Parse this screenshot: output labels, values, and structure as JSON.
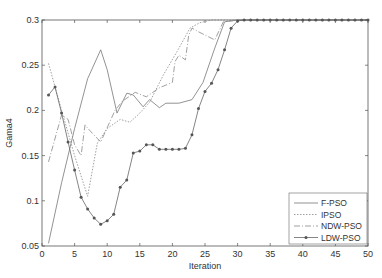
{
  "chart_data": {
    "type": "line",
    "title": "",
    "xlabel": "Iteration",
    "ylabel": "Gama4",
    "xlim": [
      0,
      50
    ],
    "ylim": [
      0.05,
      0.3
    ],
    "xticks": [
      0,
      5,
      10,
      15,
      20,
      25,
      30,
      35,
      40,
      45,
      50
    ],
    "yticks": [
      0.05,
      0.1,
      0.15,
      0.2,
      0.25,
      0.3
    ],
    "ytick_labels": [
      "0.05",
      "0.1",
      "0.15",
      "0.2",
      "0.25",
      "0.3"
    ],
    "grid": false,
    "legend_position": "lower right",
    "series": [
      {
        "name": "F-PSO",
        "style": "solid",
        "color": "#777777",
        "points": [
          [
            1,
            0.053
          ],
          [
            3,
            0.12
          ],
          [
            5,
            0.18
          ],
          [
            7,
            0.235
          ],
          [
            9,
            0.267
          ],
          [
            10,
            0.245
          ],
          [
            11.5,
            0.197
          ],
          [
            13,
            0.219
          ],
          [
            14,
            0.217
          ],
          [
            15.5,
            0.204
          ],
          [
            16.5,
            0.212
          ],
          [
            18,
            0.203
          ],
          [
            19,
            0.208
          ],
          [
            21,
            0.208
          ],
          [
            23,
            0.212
          ],
          [
            24.7,
            0.231
          ],
          [
            26.5,
            0.269
          ],
          [
            28,
            0.298
          ],
          [
            30,
            0.3
          ],
          [
            50,
            0.3
          ]
        ]
      },
      {
        "name": "IPSO",
        "style": "dotted",
        "color": "#888888",
        "points": [
          [
            1,
            0.252
          ],
          [
            3,
            0.2
          ],
          [
            5,
            0.15
          ],
          [
            7,
            0.105
          ],
          [
            8.5,
            0.164
          ],
          [
            10,
            0.18
          ],
          [
            12,
            0.19
          ],
          [
            13.5,
            0.187
          ],
          [
            15,
            0.197
          ],
          [
            16.5,
            0.209
          ],
          [
            18.6,
            0.239
          ],
          [
            20.7,
            0.265
          ],
          [
            22.7,
            0.291
          ],
          [
            24.2,
            0.297
          ],
          [
            26,
            0.3
          ],
          [
            50,
            0.3
          ]
        ]
      },
      {
        "name": "NDW-PSO",
        "style": "dashdot",
        "color": "#888888",
        "points": [
          [
            1,
            0.143
          ],
          [
            3,
            0.195
          ],
          [
            4,
            0.19
          ],
          [
            5,
            0.162
          ],
          [
            6,
            0.15
          ],
          [
            6.6,
            0.184
          ],
          [
            7.3,
            0.178
          ],
          [
            9,
            0.165
          ],
          [
            11.2,
            0.2
          ],
          [
            12.3,
            0.21
          ],
          [
            14.3,
            0.22
          ],
          [
            16,
            0.215
          ],
          [
            18,
            0.225
          ],
          [
            20,
            0.231
          ],
          [
            20.4,
            0.254
          ],
          [
            21,
            0.261
          ],
          [
            22,
            0.256
          ],
          [
            22.5,
            0.283
          ],
          [
            23,
            0.291
          ],
          [
            24,
            0.287
          ],
          [
            26.5,
            0.278
          ],
          [
            27.8,
            0.298
          ],
          [
            30,
            0.3
          ],
          [
            50,
            0.3
          ]
        ]
      },
      {
        "name": "LDW-PSO",
        "style": "solid-marker",
        "color": "#666666",
        "x": [
          1,
          2,
          3,
          4,
          5,
          6,
          7,
          8,
          9,
          10,
          11,
          12,
          13,
          14,
          15,
          16,
          17,
          18,
          19,
          20,
          21,
          22,
          23,
          24,
          25,
          26,
          27,
          28,
          29,
          30,
          31,
          32,
          33,
          34,
          35,
          36,
          37,
          38,
          39,
          40,
          41,
          42,
          43,
          44,
          45,
          46,
          47,
          48,
          49,
          50
        ],
        "values": [
          0.217,
          0.226,
          0.197,
          0.165,
          0.134,
          0.104,
          0.091,
          0.081,
          0.074,
          0.078,
          0.085,
          0.115,
          0.123,
          0.153,
          0.155,
          0.162,
          0.162,
          0.157,
          0.157,
          0.157,
          0.157,
          0.158,
          0.173,
          0.202,
          0.221,
          0.23,
          0.245,
          0.267,
          0.291,
          0.299,
          0.3,
          0.3,
          0.3,
          0.3,
          0.3,
          0.3,
          0.3,
          0.3,
          0.3,
          0.3,
          0.3,
          0.3,
          0.3,
          0.3,
          0.3,
          0.3,
          0.3,
          0.3,
          0.3,
          0.3
        ]
      }
    ]
  },
  "plot": {
    "left": 42,
    "right": 368,
    "top": 20,
    "bottom": 246
  }
}
